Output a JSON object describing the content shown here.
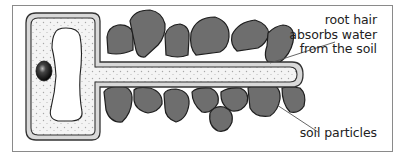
{
  "diagram": {
    "labels": {
      "root_hair": [
        "root hair",
        "absorbs water",
        "from the soil"
      ],
      "soil_particles": "soil particles"
    },
    "colors": {
      "frame": "#8a8a8a",
      "cell_wall_outer": "#333333",
      "cell_wall_fill": "#d9d9d9",
      "cytoplasm": "#f4f4f4",
      "cytoplasm_dots": "#a8a8a8",
      "vacuole": "#ffffff",
      "nucleus": "#111111",
      "soil_particle": "#6e6e6e",
      "soil_particle_outline": "#1e1e1e",
      "leader_line": "#555555"
    },
    "icons": [
      "nucleus-shape",
      "vacuole-shape",
      "soil-particle-shape"
    ]
  }
}
